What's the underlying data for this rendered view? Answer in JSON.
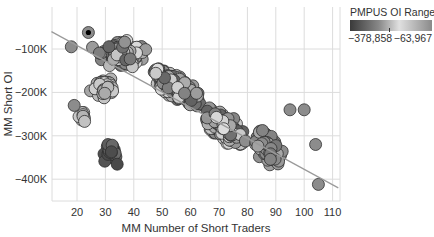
{
  "chart_data": {
    "type": "scatter",
    "title": "",
    "xlabel": "MM Number of Short Traders",
    "ylabel": "MM Short OI",
    "x_ticks": [
      "20",
      "30",
      "40",
      "50",
      "60",
      "70",
      "80",
      "90",
      "100",
      "110"
    ],
    "y_ticks": [
      "-100K",
      "-200K",
      "-300K",
      "-400K"
    ],
    "xlim": [
      11,
      112
    ],
    "ylim": [
      -465000,
      -45000
    ],
    "grid": true,
    "legend": {
      "title": "PMPUS OI Range",
      "type": "continuous",
      "min_label": "−378,858",
      "max_label": "−63,967",
      "min": -378858,
      "max": -63967,
      "position": "top-right"
    },
    "trend_line": {
      "x0": 11,
      "y0": -60000,
      "x1": 112,
      "y1": -420000
    },
    "clusters": [
      {
        "name": "upper-left dense",
        "x_center": 36,
        "x_spread": 11,
        "y_center": -110000,
        "y_spread": 45000,
        "n": 120,
        "shade": "mixed"
      },
      {
        "name": "upper-left-mid",
        "x_center": 30,
        "x_spread": 6,
        "y_center": -190000,
        "y_spread": 35000,
        "n": 55,
        "shade": "light"
      },
      {
        "name": "main band",
        "x_center": 55,
        "x_spread": 12,
        "y_center": -190000,
        "y_spread": 40000,
        "n": 220,
        "shade": "mixed"
      },
      {
        "name": "lower band",
        "x_center": 72,
        "x_spread": 10,
        "y_center": -280000,
        "y_spread": 45000,
        "n": 150,
        "shade": "mixed"
      },
      {
        "name": "right tail",
        "x_center": 88,
        "x_spread": 8,
        "y_center": -330000,
        "y_spread": 50000,
        "n": 70,
        "shade": "mid"
      },
      {
        "name": "dark lower cluster",
        "x_center": 32,
        "x_spread": 4,
        "y_center": -340000,
        "y_spread": 35000,
        "n": 25,
        "shade": "dark"
      },
      {
        "name": "left outliers",
        "x_center": 22,
        "x_spread": 2,
        "y_center": -260000,
        "y_spread": 25000,
        "n": 8,
        "shade": "light"
      }
    ],
    "notable_points": [
      {
        "x": 24,
        "y": -62000,
        "highlight": "black-center"
      },
      {
        "x": 105,
        "y": -412000
      },
      {
        "x": 104,
        "y": -320000
      },
      {
        "x": 100,
        "y": -240000
      },
      {
        "x": 95,
        "y": -240000
      },
      {
        "x": 19,
        "y": -230000
      },
      {
        "x": 18,
        "y": -95000
      }
    ]
  }
}
